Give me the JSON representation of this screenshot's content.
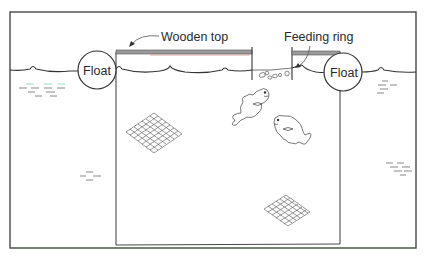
{
  "figure": {
    "labels": {
      "wooden_top": "Wooden top",
      "feeding_ring": "Feeding ring",
      "float_left": "Float",
      "float_right": "Float"
    },
    "components": [
      {
        "id": "frame",
        "desc": "outer border"
      },
      {
        "id": "water-surface",
        "desc": "wavy water line"
      },
      {
        "id": "cage",
        "desc": "rectangular net cage"
      },
      {
        "id": "wooden-top",
        "desc": "wooden top bar over cage"
      },
      {
        "id": "feeding-ring",
        "desc": "feeding ring opening with floating pellets"
      },
      {
        "id": "float-left",
        "desc": "left float"
      },
      {
        "id": "float-right",
        "desc": "right float"
      },
      {
        "id": "fish",
        "count": 2
      },
      {
        "id": "net-mesh",
        "count": 2
      }
    ],
    "colors": {
      "line": "#333333",
      "wooden_top_fill": "#9a9a9a",
      "wooden_top_accent": "#c98080",
      "water_dash_teal": "#8fcfc4",
      "background": "#ffffff"
    }
  }
}
